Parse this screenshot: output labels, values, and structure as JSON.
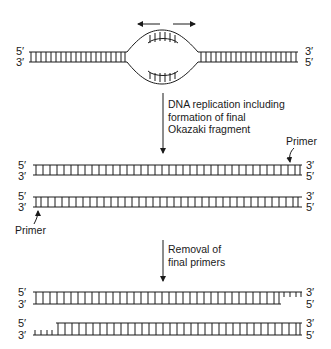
{
  "diagram": {
    "top": {
      "left_labels": {
        "top": "5′",
        "bottom": "3′"
      },
      "right_labels": {
        "top": "3′",
        "bottom": "5′"
      },
      "fork_arrows": [
        "left",
        "right"
      ]
    },
    "step1": {
      "label_lines": [
        "DNA replication including",
        "formation of final",
        "Okazaki fragment"
      ]
    },
    "middle": {
      "duplex1": {
        "left_top": "5′",
        "left_bottom": "3′",
        "right_top": "3′",
        "right_bottom": "5′",
        "primer_label": "Primer",
        "primer_side": "right"
      },
      "duplex2": {
        "left_top": "5′",
        "left_bottom": "3′",
        "right_top": "3′",
        "right_bottom": "5′",
        "primer_label": "Primer",
        "primer_side": "left"
      }
    },
    "step2": {
      "label_lines": [
        "Removal of",
        "final primers"
      ]
    },
    "bottom": {
      "duplex1": {
        "left_top": "5′",
        "left_bottom": "3′",
        "right_top": "3′",
        "right_bottom": "5′",
        "gap_side": "right"
      },
      "duplex2": {
        "left_top": "5′",
        "left_bottom": "3′",
        "right_top": "3′",
        "right_bottom": "5′",
        "gap_side": "left"
      }
    },
    "colors": {
      "line": "#1a1a1a",
      "background": "#ffffff"
    }
  }
}
